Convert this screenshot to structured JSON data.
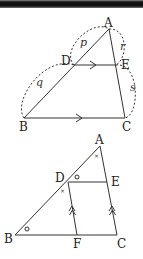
{
  "figure1": {
    "points": {
      "A": {
        "label": "A",
        "x": 109,
        "y": 29
      },
      "B": {
        "label": "B",
        "x": 24,
        "y": 118
      },
      "C": {
        "label": "C",
        "x": 125,
        "y": 118
      },
      "D": {
        "label": "D",
        "x": 74,
        "y": 65
      },
      "E": {
        "label": "E",
        "x": 116,
        "y": 65
      }
    },
    "segment_labels": {
      "p": "p",
      "q": "q",
      "r": "r",
      "s": "s"
    }
  },
  "figure2": {
    "points": {
      "A": {
        "label": "A",
        "x": 100,
        "y": 146
      },
      "B": {
        "label": "B",
        "x": 15,
        "y": 235
      },
      "C": {
        "label": "C",
        "x": 117,
        "y": 235
      },
      "D": {
        "label": "D",
        "x": 68,
        "y": 182
      },
      "E": {
        "label": "E",
        "x": 107,
        "y": 182
      },
      "F": {
        "label": "F",
        "x": 77,
        "y": 235
      }
    },
    "angle_marks": {
      "circle": "○",
      "cross": "×"
    }
  }
}
